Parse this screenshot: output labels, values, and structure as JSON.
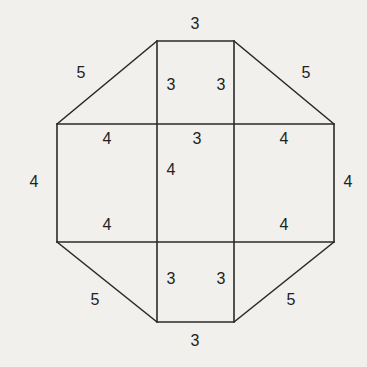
{
  "diagram": {
    "type": "net / composite figure of squares, rectangles and right triangles",
    "line_color": "#2a2a2a",
    "background": "#f1f0ec",
    "edges": [
      {
        "id": "top-edge",
        "x1": 157,
        "y1": 41,
        "x2": 234,
        "y2": 41
      },
      {
        "id": "bottom-edge",
        "x1": 157,
        "y1": 322,
        "x2": 234,
        "y2": 322
      },
      {
        "id": "left-edge",
        "x1": 57,
        "y1": 124,
        "x2": 57,
        "y2": 242
      },
      {
        "id": "right-edge",
        "x1": 334,
        "y1": 124,
        "x2": 334,
        "y2": 242
      },
      {
        "id": "v-left",
        "x1": 157,
        "y1": 41,
        "x2": 157,
        "y2": 322
      },
      {
        "id": "v-right",
        "x1": 234,
        "y1": 41,
        "x2": 234,
        "y2": 322
      },
      {
        "id": "h-top",
        "x1": 57,
        "y1": 124,
        "x2": 334,
        "y2": 124
      },
      {
        "id": "h-bottom",
        "x1": 57,
        "y1": 242,
        "x2": 334,
        "y2": 242
      },
      {
        "id": "diag-top-left",
        "x1": 57,
        "y1": 124,
        "x2": 157,
        "y2": 41
      },
      {
        "id": "diag-top-right",
        "x1": 234,
        "y1": 41,
        "x2": 334,
        "y2": 124
      },
      {
        "id": "diag-bottom-left",
        "x1": 57,
        "y1": 242,
        "x2": 157,
        "y2": 322
      },
      {
        "id": "diag-bottom-right",
        "x1": 234,
        "y1": 322,
        "x2": 334,
        "y2": 242
      }
    ],
    "labels": [
      {
        "id": "top",
        "text": "3",
        "x": 195,
        "y": 25
      },
      {
        "id": "top-left-hyp",
        "text": "5",
        "x": 81,
        "y": 74
      },
      {
        "id": "top-right-hyp",
        "text": "5",
        "x": 306,
        "y": 74
      },
      {
        "id": "top-left-inner",
        "text": "3",
        "x": 171,
        "y": 86
      },
      {
        "id": "top-right-inner",
        "text": "3",
        "x": 221,
        "y": 86
      },
      {
        "id": "h-top-left",
        "text": "4",
        "x": 107,
        "y": 140
      },
      {
        "id": "h-top-mid",
        "text": "3",
        "x": 197,
        "y": 140
      },
      {
        "id": "h-top-right",
        "text": "4",
        "x": 284,
        "y": 140
      },
      {
        "id": "center",
        "text": "4",
        "x": 171,
        "y": 171
      },
      {
        "id": "left",
        "text": "4",
        "x": 34,
        "y": 183
      },
      {
        "id": "right",
        "text": "4",
        "x": 348,
        "y": 183
      },
      {
        "id": "h-bottom-left",
        "text": "4",
        "x": 107,
        "y": 226
      },
      {
        "id": "h-bottom-right",
        "text": "4",
        "x": 284,
        "y": 226
      },
      {
        "id": "bottom-left-inner",
        "text": "3",
        "x": 171,
        "y": 280
      },
      {
        "id": "bottom-right-inner",
        "text": "3",
        "x": 221,
        "y": 280
      },
      {
        "id": "bottom-left-hyp",
        "text": "5",
        "x": 95,
        "y": 301
      },
      {
        "id": "bottom-right-hyp",
        "text": "5",
        "x": 291,
        "y": 301
      },
      {
        "id": "bottom",
        "text": "3",
        "x": 195,
        "y": 342
      }
    ]
  }
}
